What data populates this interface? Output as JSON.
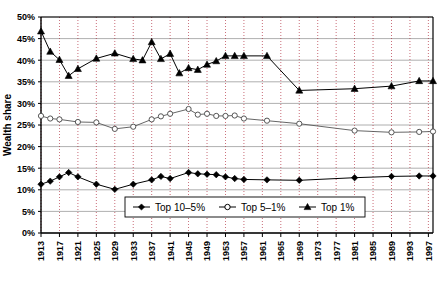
{
  "chart_data": {
    "type": "line",
    "title": "",
    "xlabel": "",
    "ylabel": "Wealth share",
    "ylim": [
      0,
      50
    ],
    "xlim": [
      1913,
      1998
    ],
    "ytick_labels": [
      "0%",
      "5%",
      "10%",
      "15%",
      "20%",
      "25%",
      "30%",
      "35%",
      "40%",
      "45%",
      "50%"
    ],
    "ytick_values": [
      0,
      5,
      10,
      15,
      20,
      25,
      30,
      35,
      40,
      45,
      50
    ],
    "xtick_labels": [
      "1913",
      "1917",
      "1921",
      "1925",
      "1929",
      "1933",
      "1937",
      "1941",
      "1945",
      "1949",
      "1953",
      "1957",
      "1961",
      "1965",
      "1969",
      "1973",
      "1977",
      "1981",
      "1985",
      "1989",
      "1993",
      "1997"
    ],
    "xtick_values": [
      1913,
      1917,
      1921,
      1925,
      1929,
      1933,
      1937,
      1941,
      1945,
      1949,
      1953,
      1957,
      1961,
      1965,
      1969,
      1973,
      1977,
      1981,
      1985,
      1989,
      1993,
      1997
    ],
    "grid": {
      "horizontal": true,
      "vertical": true,
      "vertical_style": "dotted"
    },
    "legend_position": "bottom-center",
    "series": [
      {
        "name": "Top 10-5%",
        "marker": "diamond",
        "color": "#000000",
        "points": [
          [
            1913,
            11.3
          ],
          [
            1915,
            12.0
          ],
          [
            1917,
            13.0
          ],
          [
            1919,
            14.0
          ],
          [
            1921,
            13.0
          ],
          [
            1925,
            11.3
          ],
          [
            1929,
            10.1
          ],
          [
            1933,
            11.3
          ],
          [
            1937,
            12.3
          ],
          [
            1939,
            13.1
          ],
          [
            1941,
            12.6
          ],
          [
            1945,
            14.0
          ],
          [
            1947,
            13.7
          ],
          [
            1949,
            13.6
          ],
          [
            1951,
            13.5
          ],
          [
            1953,
            13.0
          ],
          [
            1955,
            12.6
          ],
          [
            1957,
            12.4
          ],
          [
            1962,
            12.3
          ],
          [
            1969,
            12.2
          ],
          [
            1981,
            12.8
          ],
          [
            1989,
            13.1
          ],
          [
            1995,
            13.2
          ],
          [
            1998,
            13.2
          ]
        ]
      },
      {
        "name": "Top 5-1%",
        "marker": "circle-open",
        "color": "#555555",
        "points": [
          [
            1913,
            27.1
          ],
          [
            1915,
            26.5
          ],
          [
            1917,
            26.3
          ],
          [
            1921,
            25.7
          ],
          [
            1925,
            25.6
          ],
          [
            1929,
            24.1
          ],
          [
            1933,
            24.6
          ],
          [
            1937,
            26.3
          ],
          [
            1939,
            27.0
          ],
          [
            1941,
            27.6
          ],
          [
            1945,
            28.7
          ],
          [
            1947,
            27.4
          ],
          [
            1949,
            27.6
          ],
          [
            1951,
            27.1
          ],
          [
            1953,
            27.1
          ],
          [
            1955,
            27.2
          ],
          [
            1957,
            26.5
          ],
          [
            1962,
            26.0
          ],
          [
            1969,
            25.3
          ],
          [
            1981,
            23.7
          ],
          [
            1989,
            23.3
          ],
          [
            1995,
            23.4
          ],
          [
            1998,
            23.5
          ]
        ]
      },
      {
        "name": "Top 1%",
        "marker": "triangle",
        "color": "#000000",
        "points": [
          [
            1913,
            46.7
          ],
          [
            1915,
            42.0
          ],
          [
            1917,
            40.1
          ],
          [
            1919,
            36.4
          ],
          [
            1921,
            38.0
          ],
          [
            1925,
            40.4
          ],
          [
            1929,
            41.6
          ],
          [
            1933,
            40.3
          ],
          [
            1935,
            40.0
          ],
          [
            1937,
            44.2
          ],
          [
            1939,
            40.3
          ],
          [
            1941,
            41.5
          ],
          [
            1943,
            37.0
          ],
          [
            1945,
            38.2
          ],
          [
            1947,
            37.8
          ],
          [
            1949,
            39.0
          ],
          [
            1951,
            39.8
          ],
          [
            1953,
            41.0
          ],
          [
            1955,
            41.0
          ],
          [
            1957,
            41.0
          ],
          [
            1962,
            41.0
          ],
          [
            1969,
            33.0
          ],
          [
            1981,
            33.4
          ],
          [
            1989,
            34.0
          ],
          [
            1995,
            35.2
          ],
          [
            1998,
            35.2
          ]
        ]
      }
    ]
  },
  "legend": {
    "items": [
      {
        "label": "Top 10–5%",
        "marker": "diamond"
      },
      {
        "label": "Top 5–1%",
        "marker": "circle-open"
      },
      {
        "label": "Top 1%",
        "marker": "triangle"
      }
    ]
  },
  "axis": {
    "y_title": "Wealth share"
  }
}
